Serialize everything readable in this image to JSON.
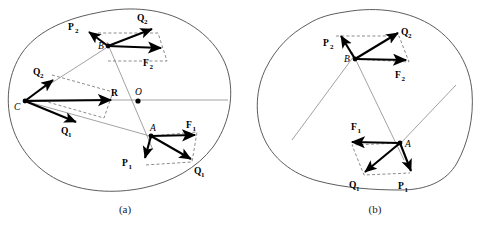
{
  "figure": {
    "captions": [
      {
        "id": "a",
        "label": "(a)"
      },
      {
        "id": "b",
        "label": "(b)"
      }
    ]
  },
  "panel_a": {
    "caption": "(a)",
    "points": [
      {
        "name": "B",
        "label": "B",
        "x": 108,
        "y": 46
      },
      {
        "name": "C",
        "label": "C",
        "x": 22,
        "y": 101
      },
      {
        "name": "O",
        "label": "O",
        "x": 139,
        "y": 100
      },
      {
        "name": "A",
        "label": "A",
        "x": 151,
        "y": 135
      }
    ],
    "vectors": [
      {
        "name": "P2",
        "label": "P",
        "sub": "2",
        "lx": 71,
        "ly": 27
      },
      {
        "name": "Q2",
        "label": "Q",
        "sub": "2",
        "lx": 140,
        "ly": 18
      },
      {
        "name": "F2",
        "label": "F",
        "sub": "2",
        "lx": 146,
        "ly": 66
      },
      {
        "name": "Q2c",
        "label": "Q",
        "sub": "2",
        "lx": 35,
        "ly": 75
      },
      {
        "name": "R",
        "label": "R",
        "lx": 110,
        "ly": 97
      },
      {
        "name": "Q1c",
        "label": "Q",
        "sub": "1",
        "lx": 63,
        "ly": 131
      },
      {
        "name": "F1",
        "label": "F",
        "sub": "1",
        "lx": 188,
        "ly": 129
      },
      {
        "name": "P1",
        "label": "P",
        "sub": "1",
        "lx": 124,
        "ly": 168
      },
      {
        "name": "Q1",
        "label": "Q",
        "sub": "1",
        "lx": 197,
        "ly": 177
      }
    ]
  },
  "panel_b": {
    "caption": "(b)",
    "points": [
      {
        "name": "B",
        "label": "B",
        "x": 355,
        "y": 59
      },
      {
        "name": "A",
        "label": "A",
        "x": 400,
        "y": 143
      }
    ],
    "vectors": [
      {
        "name": "P2",
        "label": "P",
        "sub": "2",
        "lx": 326,
        "ly": 43
      },
      {
        "name": "Q2",
        "label": "Q",
        "sub": "2",
        "lx": 404,
        "ly": 33
      },
      {
        "name": "F2",
        "label": "F",
        "sub": "2",
        "lx": 398,
        "ly": 78
      },
      {
        "name": "F1",
        "label": "F",
        "sub": "1",
        "lx": 354,
        "ly": 128
      },
      {
        "name": "Q1",
        "label": "Q",
        "sub": "1",
        "lx": 351,
        "ly": 186
      },
      {
        "name": "P1",
        "label": "P",
        "sub": "1",
        "lx": 399,
        "ly": 187
      }
    ]
  },
  "colors": {
    "outline": "#4a4a4a",
    "vector": "#000000",
    "dashed": "#6e6e6e",
    "thin": "#8a8a8a",
    "background": "#ffffff"
  }
}
